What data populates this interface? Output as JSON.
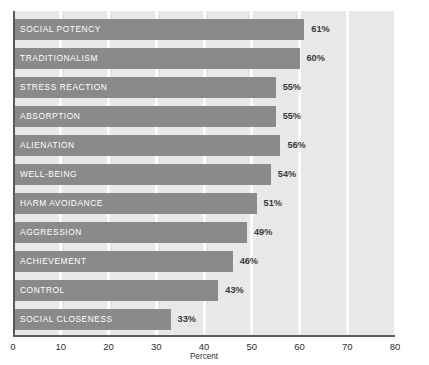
{
  "chart_data": {
    "type": "bar",
    "orientation": "horizontal",
    "title": "",
    "xlabel": "Percent",
    "ylabel": "",
    "xlim": [
      0,
      80
    ],
    "xticks": [
      0,
      10,
      20,
      30,
      40,
      50,
      60,
      70,
      80
    ],
    "xtick_labels": [
      "0",
      "10",
      "20",
      "30",
      "40",
      "50",
      "60",
      "70",
      "80"
    ],
    "grid": "vertical-white-gridlines",
    "legend": "none",
    "categories": [
      "SOCIAL POTENCY",
      "TRADITIONALISM",
      "STRESS REACTION",
      "ABSORPTION",
      "ALIENATION",
      "WELL-BEING",
      "HARM AVOIDANCE",
      "AGGRESSION",
      "ACHIEVEMENT",
      "CONTROL",
      "SOCIAL CLOSENESS"
    ],
    "values": [
      61,
      60,
      55,
      55,
      56,
      54,
      51,
      49,
      46,
      43,
      33
    ],
    "value_labels": [
      "61%",
      "60%",
      "55%",
      "55%",
      "56%",
      "54%",
      "51%",
      "49%",
      "46%",
      "43%",
      "33%"
    ],
    "bar_color": "#8a8a8a",
    "plot_background": "#e8e8e8",
    "gridline_color": "#fbfbfb",
    "axis_color": "#595959",
    "bar_label_color": "#ffffff",
    "value_label_color": "#3a3a3a"
  },
  "bars": [
    {
      "label": "SOCIAL POTENCY",
      "value": 61,
      "value_label": "61%"
    },
    {
      "label": "TRADITIONALISM",
      "value": 60,
      "value_label": "60%"
    },
    {
      "label": "STRESS REACTION",
      "value": 55,
      "value_label": "55%"
    },
    {
      "label": "ABSORPTION",
      "value": 55,
      "value_label": "55%"
    },
    {
      "label": "ALIENATION",
      "value": 56,
      "value_label": "56%"
    },
    {
      "label": "WELL-BEING",
      "value": 54,
      "value_label": "54%"
    },
    {
      "label": "HARM AVOIDANCE",
      "value": 51,
      "value_label": "51%"
    },
    {
      "label": "AGGRESSION",
      "value": 49,
      "value_label": "49%"
    },
    {
      "label": "ACHIEVEMENT",
      "value": 46,
      "value_label": "46%"
    },
    {
      "label": "CONTROL",
      "value": 43,
      "value_label": "43%"
    },
    {
      "label": "SOCIAL CLOSENESS",
      "value": 33,
      "value_label": "33%"
    }
  ],
  "axis": {
    "xlabel": "Percent",
    "ticks": [
      "0",
      "10",
      "20",
      "30",
      "40",
      "50",
      "60",
      "70",
      "80"
    ]
  }
}
